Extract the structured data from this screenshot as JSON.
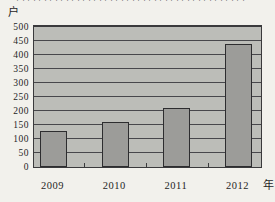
{
  "page": {
    "background": "#f2f1ec"
  },
  "top_caption": {
    "fragment": "口口口口口口口口口口口口口口口口口口口口口"
  },
  "chart_data": {
    "type": "bar",
    "title": "",
    "y_unit_label": "户",
    "x_unit_label": "年",
    "categories": [
      "2009",
      "2010",
      "2011",
      "2012"
    ],
    "values": [
      130,
      160,
      210,
      440
    ],
    "ylim": [
      0,
      500
    ],
    "ytick_step": 50,
    "yticks": [
      0,
      50,
      100,
      150,
      200,
      250,
      300,
      350,
      400,
      450,
      500
    ],
    "grid": true,
    "legend": "none",
    "colors": {
      "page_bg": "#f2f1ec",
      "plot_bg": "#bcbdb8",
      "bar_fill": "#9c9c99",
      "bar_border": "#2d2d2f",
      "gridline": "#47474b",
      "axis_border": "#3a3a3c",
      "text": "#1f1f1f"
    }
  }
}
